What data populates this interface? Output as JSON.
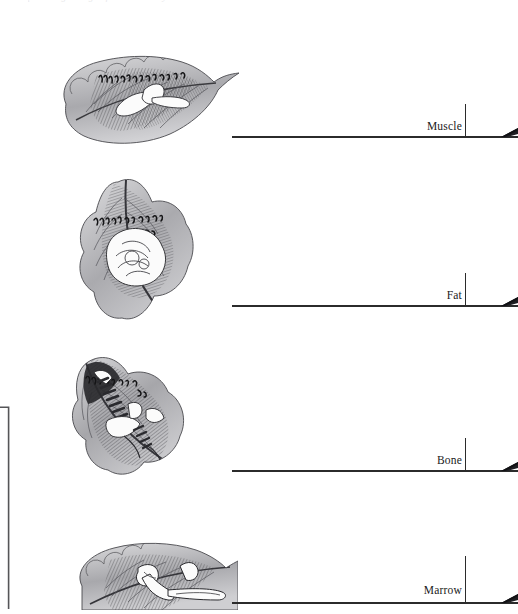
{
  "page": {
    "background_color": "#ffffff",
    "ink_color": "#2b2b2b",
    "top_clipped_caption": "plate engravings of the tissue layers"
  },
  "left_bracket": {
    "name": "left-bracket-rule",
    "visible": true
  },
  "plates": [
    {
      "id": "plate-muscle",
      "caption": "engraved leaf-shaped anatomical plate with muscle fibres and script annotation",
      "inscription": "script-annotation"
    },
    {
      "id": "plate-fat",
      "caption": "engraved leaf-shaped anatomical plate with lobulated fat mass and script annotation",
      "inscription": "script-annotation"
    },
    {
      "id": "plate-bone",
      "caption": "engraved leaf-shaped anatomical plate with vertebral / rib bone structures",
      "inscription": "script-annotation"
    },
    {
      "id": "plate-marrow",
      "caption": "engraved leaf-shaped anatomical plate with long bone and marrow cavity",
      "inscription": "script-annotation"
    }
  ],
  "measure_rows": [
    {
      "label": "Muscle",
      "tick": true,
      "wedge": true
    },
    {
      "label": "Fat",
      "tick": true,
      "wedge": true
    },
    {
      "label": "Bone",
      "tick": true,
      "wedge": true
    },
    {
      "label": "Marrow",
      "tick": true,
      "wedge": true
    }
  ]
}
